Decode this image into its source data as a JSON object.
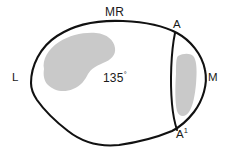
{
  "figure": {
    "type": "anatomical-cross-section-diagram",
    "background_color": "#ffffff",
    "outline_color": "#111111",
    "shaded_region_color": "#c9c9c9"
  },
  "labels": {
    "top": "MR",
    "top_right": "A",
    "right": "M",
    "left": "L",
    "bottom_right_base": "A",
    "bottom_right_superscript": "1",
    "angle_value": "135",
    "angle_unit": "°"
  },
  "annotations": {
    "angle_full": "135°",
    "point_a_prime_full": "A1"
  },
  "regions": [
    {
      "name": "left-shaded-region",
      "color": "#c9c9c9",
      "position": "left-upper-interior"
    },
    {
      "name": "right-shaded-region",
      "color": "#c9c9c9",
      "position": "right-interior"
    }
  ],
  "lines": [
    {
      "name": "divider-line-a-to-a-prime",
      "from": "A",
      "to": "A1",
      "color": "#111111"
    }
  ]
}
